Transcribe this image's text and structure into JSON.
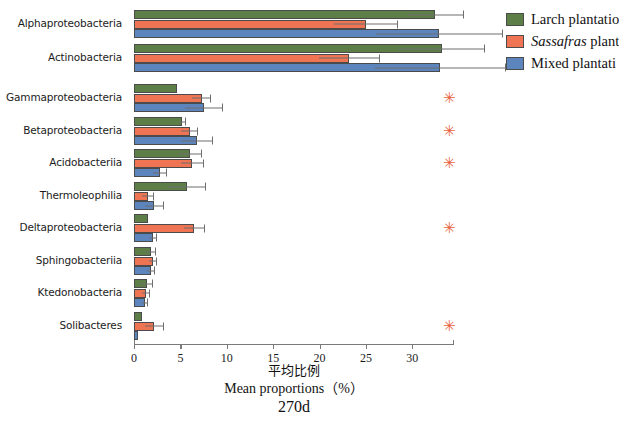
{
  "chart_data": {
    "type": "bar",
    "orientation": "horizontal",
    "title": "",
    "panel_label": "270d",
    "xlabel_cn": "平均比例",
    "xlabel_en": "Mean proportions（%）",
    "ylabel": "",
    "xlim": [
      0,
      34.5
    ],
    "xticks": [
      0,
      5,
      10,
      15,
      20,
      25,
      30
    ],
    "xtick_labels": [
      "0",
      "5",
      "10",
      "15",
      "20",
      "25",
      "30"
    ],
    "grid": false,
    "legend_position": "right-top",
    "categories": [
      "Alphaproteobacteria",
      "Actinobacteria",
      "Gammaproteobacteria",
      "Betaproteobacteria",
      "Acidobacteriia",
      "Thermoleophilia",
      "Deltaproteobacteria",
      "Sphingobacteriia",
      "Ktedonobacteria",
      "Solibacteres"
    ],
    "series": [
      {
        "name": "Larch plantatio",
        "color": "#5d7f47",
        "values": [
          32.5,
          33.2,
          4.6,
          5.2,
          6.0,
          5.7,
          1.5,
          1.8,
          1.4,
          0.9
        ],
        "errors": [
          3.0,
          4.6,
          0.0,
          0.4,
          1.3,
          2.0,
          0.0,
          0.5,
          0.6,
          0.0
        ]
      },
      {
        "name": "Sassafras plant",
        "color": "#ee7453",
        "values": [
          25.0,
          23.2,
          7.3,
          6.0,
          6.3,
          1.5,
          6.5,
          2.0,
          1.3,
          2.2
        ],
        "errors": [
          3.4,
          3.3,
          1.0,
          0.9,
          1.2,
          0.6,
          1.1,
          0.4,
          0.4,
          1.0
        ]
      },
      {
        "name": "Mixed plantati",
        "color": "#5c85be",
        "values": [
          32.9,
          33.0,
          7.5,
          6.8,
          2.8,
          2.2,
          2.0,
          1.8,
          1.2,
          0.4
        ],
        "errors": [
          6.8,
          7.0,
          2.0,
          1.7,
          0.7,
          1.0,
          0.4,
          0.4,
          0.3,
          0.0
        ]
      }
    ],
    "significance": {
      "marker": "✳",
      "color": "#e8643f",
      "x_position": 34.0,
      "categories": [
        "Gammaproteobacteria",
        "Betaproteobacteria",
        "Acidobacteriia",
        "Deltaproteobacteria",
        "Solibacteres"
      ]
    }
  },
  "legend": {
    "items": [
      {
        "label": "Larch plantatio",
        "swatch": "legend-swatch-green",
        "italic_lead": ""
      },
      {
        "label": " plant",
        "swatch": "legend-swatch-orange",
        "italic_lead": "Sassafras"
      },
      {
        "label": "Mixed plantati",
        "swatch": "legend-swatch-blue",
        "italic_lead": ""
      }
    ]
  }
}
